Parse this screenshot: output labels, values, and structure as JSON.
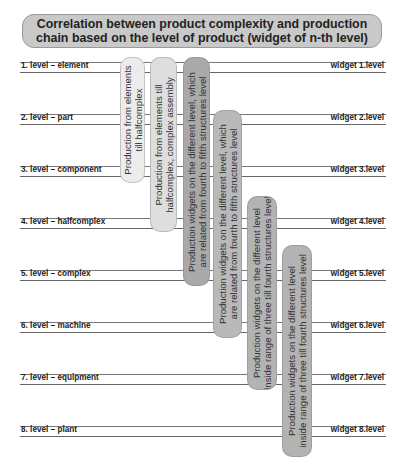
{
  "title": {
    "line1": "Correlation between product complexity and production",
    "line2": "chain based on the level of product (widget of n-th level)"
  },
  "levels": [
    {
      "label": "1. level – element",
      "widget": "widget 1.level"
    },
    {
      "label": "2. level – part",
      "widget": "widget 2.level"
    },
    {
      "label": "3. level – component",
      "widget": "widget 3.level"
    },
    {
      "label": "4. level – halfcomplex",
      "widget": "widget 4.level"
    },
    {
      "label": "5. level – complex",
      "widget": "widget 5.level"
    },
    {
      "label": "6. level – machine",
      "widget": "widget 6.level"
    },
    {
      "label": "7. level – equipment",
      "widget": "widget 7.level"
    },
    {
      "label": "8. level – plant",
      "widget": "widget 8.level"
    }
  ],
  "bars": [
    {
      "line1": "Production from elements",
      "line2": "till halfcomplex",
      "color": "#ececec",
      "from_level": 1,
      "to_level": 3
    },
    {
      "line1": "Production from elements till",
      "line2": "halfcomplex, complex assembly",
      "color": "#dedede",
      "from_level": 1,
      "to_level": 4
    },
    {
      "line1": "Production widgets on the different level, which",
      "line2": "are related from fourth to fifth structures level",
      "color": "#a9a9a9",
      "from_level": 1,
      "to_level": 5
    },
    {
      "line1": "Production widgets on the different level, which",
      "line2": "are related from fourth to fifth structures level",
      "color": "#b9b9b9",
      "from_level": 2,
      "to_level": 6
    },
    {
      "line1": "Production widgets on the different level",
      "line2": "inside range of three till fourth structures level",
      "color": "#b3b3b3",
      "from_level": 4,
      "to_level": 7
    },
    {
      "line1": "Production widgets on the different level",
      "line2": "inside range of three till fourth structures level",
      "color": "#b3b3b3",
      "from_level": 5,
      "to_level": 8
    }
  ]
}
